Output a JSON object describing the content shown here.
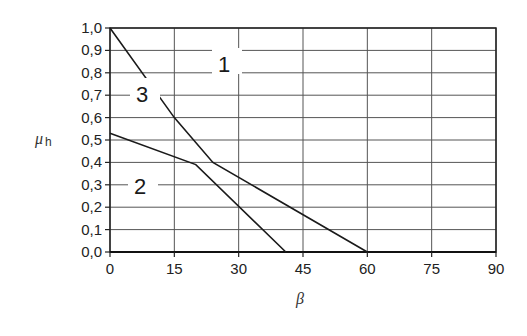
{
  "chart_data": {
    "type": "line",
    "title": "",
    "xlabel": "β",
    "ylabel": "μh",
    "xlim": [
      0,
      90
    ],
    "ylim": [
      0.0,
      1.0
    ],
    "x_ticks": [
      "0",
      "15",
      "30",
      "45",
      "60",
      "75",
      "90"
    ],
    "y_ticks": [
      "0,0",
      "0,1",
      "0,2",
      "0,3",
      "0,4",
      "0,5",
      "0,6",
      "0,7",
      "0,8",
      "0,9",
      "1,0"
    ],
    "grid": true,
    "legend": "inline numeric labels",
    "series": [
      {
        "name": "1",
        "points": [
          [
            0,
            1.0
          ],
          [
            15,
            0.6
          ],
          [
            24,
            0.4
          ],
          [
            60,
            0.0
          ]
        ]
      },
      {
        "name": "2",
        "points": [
          [
            0,
            0.53
          ],
          [
            20,
            0.39
          ],
          [
            41,
            0.0
          ]
        ]
      }
    ],
    "annotations": [
      {
        "text": "1",
        "x": 27,
        "y": 0.85
      },
      {
        "text": "3",
        "x": 8,
        "y": 0.6
      },
      {
        "text": "2",
        "x": 7,
        "y": 0.3
      }
    ]
  },
  "labels": {
    "ylabel_main": "μ",
    "ylabel_sub": "h",
    "xlabel": "β",
    "curve1": "1",
    "curve2": "2",
    "curve3": "3"
  }
}
